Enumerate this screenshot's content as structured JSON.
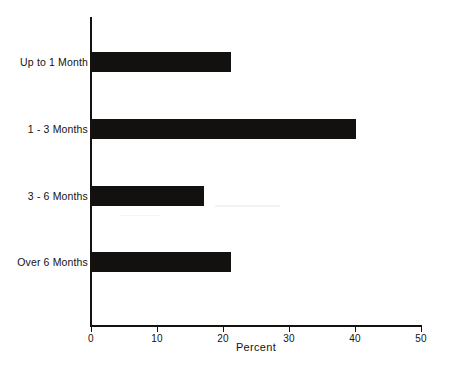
{
  "chart_data": {
    "type": "bar",
    "orientation": "horizontal",
    "title": "",
    "xlabel": "Percent",
    "ylabel": "",
    "categories": [
      "Up to 1 Month",
      "1 - 3 Months",
      "3 - 6 Months",
      "Over 6 Months"
    ],
    "values": [
      21,
      40,
      17,
      21
    ],
    "xlim": [
      0,
      50
    ],
    "xticks": [
      0,
      10,
      20,
      30,
      40,
      50
    ],
    "xtick_labels": [
      "0",
      "10",
      "20",
      "30",
      "40",
      "50"
    ],
    "grid": false,
    "legend": false,
    "series": [
      {
        "name": "Percent",
        "values": [
          21,
          40,
          17,
          21
        ]
      }
    ]
  },
  "axis": {
    "x_title": "Percent",
    "tick_labels": [
      "0",
      "10",
      "20",
      "30",
      "40",
      "50"
    ]
  },
  "bars": [
    {
      "label": "Up to 1 Month",
      "value": 21
    },
    {
      "label": "1 - 3 Months",
      "value": 40
    },
    {
      "label": "3 - 6 Months",
      "value": 17
    },
    {
      "label": "Over 6 Months",
      "value": 21
    }
  ],
  "colors": {
    "bar": "#121110",
    "axis": "#14110f",
    "text": "#16120f",
    "background": "#ffffff"
  }
}
